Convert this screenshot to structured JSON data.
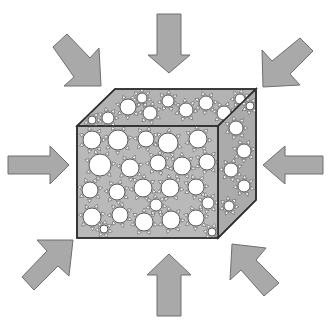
{
  "diagram": {
    "title": "",
    "colors": {
      "arrow_fill": "#a9a9a9",
      "arrow_stroke": "#6e6e6e",
      "cube_fill": "#b9b9b9",
      "cube_edge": "#2e2e2e",
      "pore_fill": "#ffffff",
      "pore_stroke": "#4a4a4a"
    },
    "cube": {
      "front_face": {
        "x1": 77,
        "y1": 126,
        "x2": 218,
        "y2": 238
      },
      "back_offset": {
        "dx": 38,
        "dy": -37
      }
    },
    "arrows": [
      {
        "name": "arrow-top",
        "direction": "down",
        "points": "157,14 181,14 181,55 190,55 169,73 148,55 157,55"
      },
      {
        "name": "arrow-bottom",
        "direction": "up",
        "points": "157,316 181,316 181,275 191,275 169,254 147,275 157,275"
      },
      {
        "name": "arrow-left",
        "direction": "right",
        "points": "8,156 50,156 50,146 69,165 50,184 50,174 8,174"
      },
      {
        "name": "arrow-right",
        "direction": "left",
        "points": "323,156 285,156 285,146 263,165 285,184 285,174 323,174"
      },
      {
        "name": "arrow-top-left",
        "direction": "down-right",
        "points": "53,47 67,34 90,58 99,48 101,86 64,86 74,77"
      },
      {
        "name": "arrow-top-right",
        "direction": "down-left",
        "points": "300,38 313,51 290,74 300,85 263,87 262,50 272,61"
      },
      {
        "name": "arrow-bottom-left",
        "direction": "up-right",
        "points": "22,277 34,290 58,266 69,276 73,240 37,240 47,251"
      },
      {
        "name": "arrow-bottom-right",
        "direction": "up-left",
        "points": "264,296 279,283 256,260 266,248 232,244 230,280 241,270"
      }
    ],
    "pores_front": [
      {
        "cx": 92,
        "cy": 140,
        "r": 9
      },
      {
        "cx": 118,
        "cy": 140,
        "r": 10
      },
      {
        "cx": 146,
        "cy": 139,
        "r": 8
      },
      {
        "cx": 168,
        "cy": 143,
        "r": 10
      },
      {
        "cx": 198,
        "cy": 139,
        "r": 9
      },
      {
        "cx": 100,
        "cy": 165,
        "r": 11
      },
      {
        "cx": 130,
        "cy": 168,
        "r": 9
      },
      {
        "cx": 158,
        "cy": 163,
        "r": 8
      },
      {
        "cx": 182,
        "cy": 166,
        "r": 9
      },
      {
        "cx": 207,
        "cy": 162,
        "r": 8
      },
      {
        "cx": 90,
        "cy": 190,
        "r": 8
      },
      {
        "cx": 117,
        "cy": 192,
        "r": 8
      },
      {
        "cx": 143,
        "cy": 188,
        "r": 9
      },
      {
        "cx": 170,
        "cy": 188,
        "r": 9
      },
      {
        "cx": 196,
        "cy": 187,
        "r": 8
      },
      {
        "cx": 92,
        "cy": 217,
        "r": 9
      },
      {
        "cx": 120,
        "cy": 215,
        "r": 8
      },
      {
        "cx": 144,
        "cy": 222,
        "r": 9
      },
      {
        "cx": 171,
        "cy": 220,
        "r": 9
      },
      {
        "cx": 196,
        "cy": 218,
        "r": 8
      },
      {
        "cx": 212,
        "cy": 232,
        "r": 4
      },
      {
        "cx": 104,
        "cy": 229,
        "r": 4
      },
      {
        "cx": 156,
        "cy": 205,
        "r": 6
      },
      {
        "cx": 208,
        "cy": 203,
        "r": 6
      }
    ],
    "pores_top": [
      {
        "cx": 108,
        "cy": 118,
        "r": 6
      },
      {
        "cx": 128,
        "cy": 107,
        "r": 8
      },
      {
        "cx": 150,
        "cy": 113,
        "r": 7
      },
      {
        "cx": 168,
        "cy": 101,
        "r": 6
      },
      {
        "cx": 186,
        "cy": 110,
        "r": 7
      },
      {
        "cx": 206,
        "cy": 103,
        "r": 7
      },
      {
        "cx": 224,
        "cy": 113,
        "r": 7
      },
      {
        "cx": 240,
        "cy": 99,
        "r": 5
      },
      {
        "cx": 142,
        "cy": 98,
        "r": 5
      },
      {
        "cx": 92,
        "cy": 120,
        "r": 4
      }
    ],
    "pores_side": [
      {
        "cx": 236,
        "cy": 128,
        "r": 7
      },
      {
        "cx": 244,
        "cy": 151,
        "r": 7
      },
      {
        "cx": 231,
        "cy": 170,
        "r": 7
      },
      {
        "cx": 244,
        "cy": 186,
        "r": 6
      },
      {
        "cx": 229,
        "cy": 206,
        "r": 5
      },
      {
        "cx": 250,
        "cy": 106,
        "r": 4
      }
    ]
  }
}
